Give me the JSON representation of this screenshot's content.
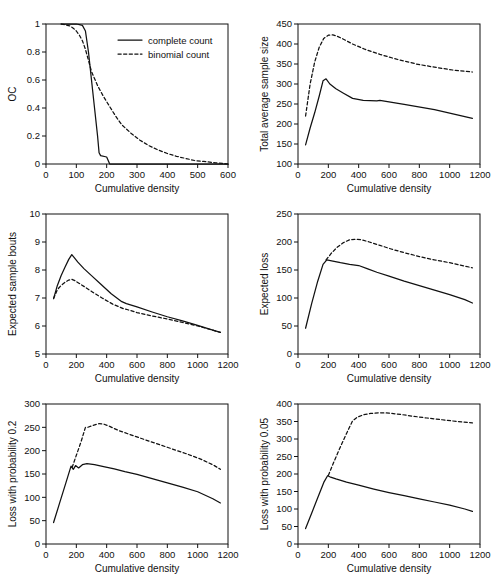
{
  "figure": {
    "name": "six-panel-sampling-plan-comparison",
    "legend": {
      "series": [
        {
          "key": "complete",
          "label": "complete count",
          "style": "solid"
        },
        {
          "key": "binomial",
          "label": "binomial count",
          "style": "dashed"
        }
      ]
    },
    "shared_xlabel": "Cumulative density"
  },
  "chart_data": [
    {
      "id": "oc",
      "type": "line",
      "title": "",
      "xlabel": "Cumulative density",
      "ylabel": "OC",
      "xlim": [
        0,
        600
      ],
      "ylim": [
        0,
        1
      ],
      "xticks": [
        0,
        100,
        200,
        300,
        400,
        500,
        600
      ],
      "yticks": [
        0,
        0.2,
        0.4,
        0.6,
        0.8,
        1
      ],
      "ytick_labels": [
        "0",
        "0.2",
        "0.4",
        "0.6",
        "0.8",
        "1"
      ],
      "grid": false,
      "legend_position": "upper right",
      "series": [
        {
          "name": "complete count",
          "style": "solid",
          "x": [
            50,
            70,
            90,
            100,
            110,
            120,
            130,
            140,
            150,
            160,
            170,
            175,
            180,
            200,
            210,
            600
          ],
          "y": [
            1.0,
            1.0,
            1.0,
            1.0,
            0.995,
            0.99,
            0.95,
            0.8,
            0.6,
            0.4,
            0.2,
            0.08,
            0.06,
            0.05,
            0.0,
            0.0
          ]
        },
        {
          "name": "binomial count",
          "style": "dashed",
          "x": [
            50,
            70,
            80,
            90,
            100,
            110,
            120,
            130,
            140,
            150,
            170,
            190,
            210,
            230,
            250,
            280,
            310,
            340,
            370,
            400,
            430,
            460,
            490,
            520,
            560,
            600
          ],
          "y": [
            1.0,
            0.99,
            0.985,
            0.97,
            0.95,
            0.92,
            0.88,
            0.82,
            0.74,
            0.66,
            0.56,
            0.48,
            0.41,
            0.34,
            0.28,
            0.22,
            0.17,
            0.13,
            0.1,
            0.075,
            0.055,
            0.04,
            0.025,
            0.018,
            0.008,
            0.0
          ]
        }
      ]
    },
    {
      "id": "total-average-sample-size",
      "type": "line",
      "title": "",
      "xlabel": "Cumulative density",
      "ylabel": "Total average sample size",
      "xlim": [
        0,
        1200
      ],
      "ylim": [
        100,
        450
      ],
      "xticks": [
        0,
        200,
        400,
        600,
        800,
        1000,
        1200
      ],
      "yticks": [
        100,
        150,
        200,
        250,
        300,
        350,
        400,
        450
      ],
      "grid": false,
      "series": [
        {
          "name": "complete count",
          "style": "solid",
          "x": [
            50,
            80,
            110,
            140,
            165,
            185,
            210,
            250,
            300,
            360,
            430,
            520,
            540,
            700,
            900,
            1050,
            1150
          ],
          "y": [
            148,
            190,
            228,
            270,
            308,
            313,
            300,
            288,
            277,
            264,
            259,
            258,
            259,
            249,
            236,
            223,
            214
          ]
        },
        {
          "name": "binomial count",
          "style": "dashed",
          "x": [
            50,
            80,
            110,
            140,
            170,
            200,
            230,
            260,
            300,
            360,
            440,
            540,
            650,
            780,
            900,
            1020,
            1150
          ],
          "y": [
            220,
            300,
            355,
            392,
            414,
            422,
            423,
            419,
            412,
            400,
            387,
            374,
            362,
            350,
            342,
            335,
            330
          ]
        }
      ]
    },
    {
      "id": "expected-sample-bouts",
      "type": "line",
      "title": "",
      "xlabel": "Cumulative density",
      "ylabel": "Expected sample bouts",
      "xlim": [
        0,
        1200
      ],
      "ylim": [
        5,
        10
      ],
      "xticks": [
        0,
        200,
        400,
        600,
        800,
        1000,
        1200
      ],
      "yticks": [
        5,
        6,
        7,
        8,
        9,
        10
      ],
      "grid": false,
      "series": [
        {
          "name": "complete count",
          "style": "solid",
          "x": [
            50,
            75,
            100,
            125,
            150,
            170,
            185,
            210,
            250,
            300,
            360,
            430,
            500,
            530,
            600,
            700,
            800,
            900,
            1000,
            1100,
            1150
          ],
          "y": [
            6.98,
            7.45,
            7.8,
            8.1,
            8.38,
            8.55,
            8.45,
            8.28,
            8.05,
            7.8,
            7.5,
            7.15,
            6.87,
            6.8,
            6.68,
            6.5,
            6.33,
            6.18,
            6.02,
            5.85,
            5.77
          ]
        },
        {
          "name": "binomial count",
          "style": "dashed",
          "x": [
            50,
            75,
            100,
            125,
            150,
            170,
            190,
            220,
            260,
            310,
            370,
            440,
            510,
            540,
            600,
            700,
            800,
            900,
            1000,
            1100,
            1150
          ],
          "y": [
            6.98,
            7.3,
            7.45,
            7.56,
            7.64,
            7.67,
            7.62,
            7.52,
            7.38,
            7.2,
            7.0,
            6.78,
            6.62,
            6.58,
            6.48,
            6.36,
            6.25,
            6.13,
            6.0,
            5.85,
            5.77
          ]
        }
      ]
    },
    {
      "id": "expected-loss",
      "type": "line",
      "title": "",
      "xlabel": "Cumulative density",
      "ylabel": "Expected loss",
      "xlim": [
        0,
        1200
      ],
      "ylim": [
        0,
        250
      ],
      "xticks": [
        0,
        200,
        400,
        600,
        800,
        1000,
        1200
      ],
      "yticks": [
        0,
        50,
        100,
        150,
        200,
        250
      ],
      "grid": false,
      "series": [
        {
          "name": "complete count",
          "style": "solid",
          "x": [
            50,
            90,
            130,
            165,
            190,
            230,
            280,
            340,
            400,
            460,
            520,
            600,
            700,
            800,
            900,
            1000,
            1100,
            1150
          ],
          "y": [
            46,
            90,
            130,
            160,
            168,
            166,
            163,
            160,
            158,
            152,
            146,
            139,
            130,
            122,
            114,
            106,
            97,
            91
          ]
        },
        {
          "name": "binomial count",
          "style": "dashed",
          "x": [
            185,
            220,
            260,
            300,
            340,
            380,
            420,
            470,
            540,
            620,
            700,
            800,
            900,
            1000,
            1100,
            1150
          ],
          "y": [
            168,
            180,
            191,
            199,
            204,
            205,
            204,
            200,
            194,
            187,
            181,
            174,
            168,
            163,
            157,
            154
          ]
        }
      ]
    },
    {
      "id": "loss-with-probability-0.2",
      "type": "line",
      "title": "",
      "xlabel": "Cumulative density",
      "ylabel": "Loss with probability 0.2",
      "xlim": [
        0,
        1200
      ],
      "ylim": [
        0,
        300
      ],
      "xticks": [
        0,
        200,
        400,
        600,
        800,
        1000,
        1200
      ],
      "yticks": [
        0,
        50,
        100,
        150,
        200,
        250,
        300
      ],
      "grid": false,
      "series": [
        {
          "name": "complete count",
          "style": "solid",
          "x": [
            50,
            90,
            130,
            165,
            180,
            195,
            215,
            240,
            270,
            320,
            380,
            450,
            520,
            600,
            700,
            800,
            900,
            1000,
            1100,
            1150
          ],
          "y": [
            46,
            88,
            130,
            167,
            160,
            168,
            163,
            170,
            172,
            170,
            166,
            161,
            155,
            149,
            140,
            131,
            122,
            112,
            97,
            88
          ]
        },
        {
          "name": "binomial count",
          "style": "dashed",
          "x": [
            172,
            200,
            230,
            260,
            275,
            310,
            350,
            380,
            420,
            480,
            550,
            630,
            720,
            820,
            920,
            1020,
            1110,
            1150
          ],
          "y": [
            164,
            190,
            218,
            250,
            250,
            254,
            258,
            257,
            252,
            243,
            235,
            226,
            216,
            205,
            194,
            182,
            168,
            160
          ]
        }
      ]
    },
    {
      "id": "loss-with-probability-0.05",
      "type": "line",
      "title": "",
      "xlabel": "Cumulative density",
      "ylabel": "Loss with probability 0.05",
      "xlim": [
        0,
        1200
      ],
      "ylim": [
        0,
        400
      ],
      "xticks": [
        0,
        200,
        400,
        600,
        800,
        1000,
        1200
      ],
      "yticks": [
        0,
        50,
        100,
        150,
        200,
        250,
        300,
        350,
        400
      ],
      "grid": false,
      "series": [
        {
          "name": "complete count",
          "style": "solid",
          "x": [
            50,
            90,
            130,
            170,
            195,
            210,
            250,
            320,
            400,
            500,
            600,
            700,
            800,
            900,
            1000,
            1100,
            1150
          ],
          "y": [
            44,
            88,
            132,
            176,
            195,
            192,
            186,
            177,
            168,
            157,
            147,
            138,
            129,
            120,
            111,
            100,
            93
          ]
        },
        {
          "name": "binomial count",
          "style": "dashed",
          "x": [
            200,
            240,
            280,
            320,
            360,
            390,
            430,
            480,
            540,
            600,
            680,
            760,
            850,
            950,
            1050,
            1150
          ],
          "y": [
            196,
            238,
            278,
            316,
            352,
            362,
            369,
            373,
            375,
            374,
            370,
            365,
            360,
            355,
            350,
            346
          ]
        }
      ]
    }
  ],
  "noise_top": "scan artifact text"
}
